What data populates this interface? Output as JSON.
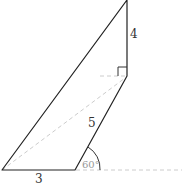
{
  "diagram": {
    "type": "geometry",
    "labels": {
      "side_top": "4",
      "side_middle": "5",
      "side_bottom": "3",
      "angle": "60°"
    },
    "points": {
      "top": [
        127,
        0
      ],
      "right_angle": [
        127,
        76
      ],
      "bottom_right": [
        75,
        170
      ],
      "bottom_left": [
        2,
        170
      ]
    },
    "colors": {
      "solid_line": "#222222",
      "dashed_line": "#cccccc",
      "angle_arc": "#333333"
    }
  }
}
